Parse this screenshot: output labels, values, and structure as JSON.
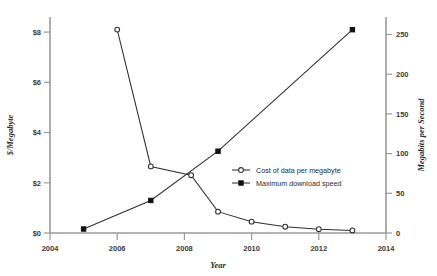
{
  "chart_data": {
    "type": "line",
    "title": "",
    "xlabel": "Year",
    "ylabel": "$/Megabyte",
    "y2label": "Megabits per Second",
    "xlim": [
      2004,
      2014
    ],
    "ylim": [
      0,
      8.6
    ],
    "y2lim": [
      0,
      272
    ],
    "grid": false,
    "legend_position": "center-right",
    "xticks": [
      "2004",
      "2006",
      "2008",
      "2010",
      "2012",
      "2014"
    ],
    "xtick_values": [
      2004,
      2006,
      2008,
      2010,
      2012,
      2014
    ],
    "yticks": [
      "$0",
      "$2",
      "$4",
      "$6",
      "$8"
    ],
    "ytick_values": [
      0,
      2,
      4,
      6,
      8
    ],
    "y2ticks": [
      "0",
      "50",
      "100",
      "150",
      "200",
      "250"
    ],
    "y2tick_values": [
      0,
      50,
      100,
      150,
      200,
      250
    ],
    "series": [
      {
        "name": "Cost of data per megabyte",
        "axis": "left",
        "marker": "open-circle",
        "x": [
          2006,
          2007,
          2008.2,
          2009,
          2010,
          2011,
          2012,
          2013
        ],
        "values": [
          8.1,
          2.65,
          2.3,
          0.85,
          0.45,
          0.25,
          0.15,
          0.1
        ]
      },
      {
        "name": "Maximum download speed",
        "axis": "right",
        "marker": "filled-square",
        "x": [
          2005,
          2007,
          2009,
          2013
        ],
        "values": [
          5,
          41,
          103,
          256
        ]
      }
    ]
  },
  "legend": {
    "entries": [
      {
        "label": "Cost of data per megabyte",
        "marker": "open-circle"
      },
      {
        "label": "Maximum download speed",
        "marker": "filled-square"
      }
    ]
  },
  "colors": {
    "line": "#2f2f2f",
    "spine": "#9a9a9a",
    "text": "#2b2b2b",
    "background": "#ffffff"
  }
}
